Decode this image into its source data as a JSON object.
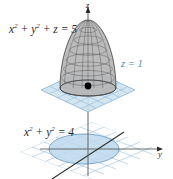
{
  "figure": {
    "background_color": "#ffffff",
    "labels": {
      "surface_equation": "x² + y² + z = 5",
      "surface_equation_parts": {
        "base": "x",
        "exp1": "2",
        "plus1": " + ",
        "base2": "y",
        "exp2": "2",
        "tail": " + z = 5"
      },
      "plane_equation": "z = 1",
      "circle_equation": "x² + y² = 4",
      "circle_equation_parts": {
        "base": "x",
        "exp1": "2",
        "plus1": " + ",
        "base2": "y",
        "exp2": "2",
        "tail": " = 4"
      },
      "axis_z": "z",
      "axis_y": "y"
    },
    "colors": {
      "plane_fill": "#cfe2f1",
      "plane_grid_line": "#8fb8d6",
      "plane_label_text": "#5b86a8",
      "circle_fill": "#bcd8ec",
      "circle_stroke": "#6f9fc4",
      "surface_fill": "#b9b9b9",
      "surface_mesh": "#4a4a4a",
      "axis_line": "#6b6b6b",
      "x_axis_line": "#3a3a3a",
      "point_marker": "#000000",
      "text": "#2b2b2b"
    },
    "geometry": {
      "point_marker": {
        "label": "intersection-point",
        "x": 88,
        "y": 86
      },
      "z_axis": {
        "x": 88,
        "top_y": 8,
        "bottom_y": 176
      },
      "upper_plane_center": {
        "x": 88,
        "y": 90
      },
      "lower_plane_center": {
        "x": 92,
        "y": 152
      },
      "paraboloid_apex": {
        "x": 88,
        "y": 20
      },
      "paraboloid_base_rx": 28,
      "paraboloid_base_ry": 8,
      "projection_circle": {
        "cx": 84,
        "cy": 149,
        "rx": 35,
        "ry": 15
      }
    }
  }
}
